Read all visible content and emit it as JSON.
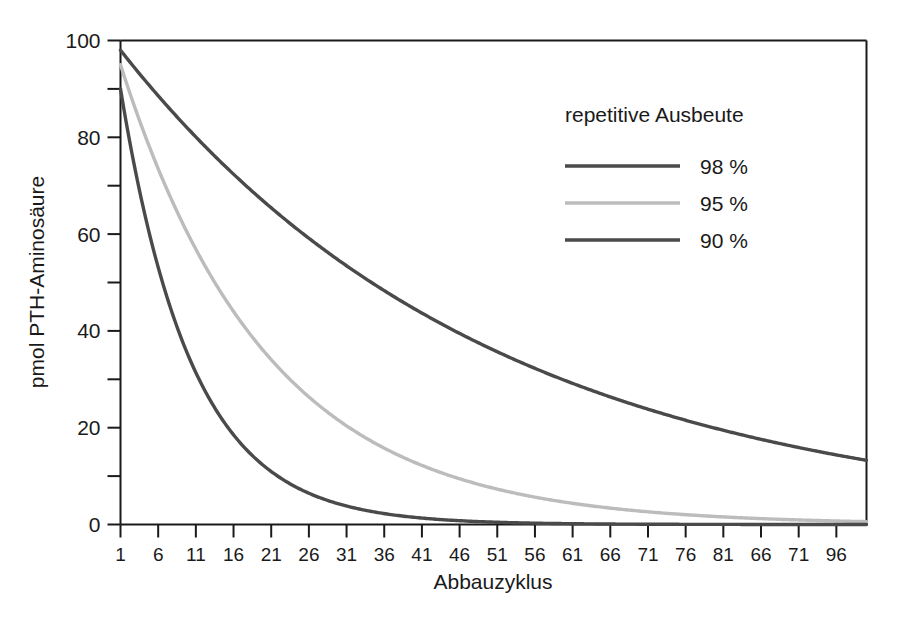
{
  "chart_data": {
    "type": "line",
    "title": "",
    "subtitle": "",
    "xlabel": "Abbauzyklus",
    "ylabel": "pmol PTH-Aminosäure",
    "xlim": [
      1,
      100
    ],
    "ylim": [
      0,
      100
    ],
    "grid": false,
    "legend_position": "top-right",
    "legend_title": "repetitive Ausbeute",
    "y_major_ticks": [
      0,
      20,
      40,
      60,
      80,
      100
    ],
    "y_major_tick_labels": [
      "0",
      "20",
      "40",
      "60",
      "80",
      "100"
    ],
    "y_minor_ticks": [
      10,
      30,
      50,
      70,
      90
    ],
    "x_tick_values": [
      1,
      6,
      11,
      16,
      21,
      26,
      31,
      36,
      41,
      46,
      51,
      56,
      61,
      66,
      71,
      76,
      81,
      86,
      91,
      96
    ],
    "x_tick_labels": [
      "1",
      "6",
      "11",
      "16",
      "21",
      "26",
      "31",
      "36",
      "41",
      "46",
      "51",
      "56",
      "61",
      "66",
      "71",
      "76",
      "81",
      "66",
      "71",
      "96"
    ],
    "series": [
      {
        "name": "98 %",
        "color": "#4a4a4a",
        "yield": 0.98,
        "start_value": 98,
        "x": [
          1,
          6,
          11,
          16,
          21,
          26,
          31,
          36,
          41,
          46,
          51,
          56,
          61,
          66,
          71,
          76,
          81,
          86,
          91,
          96,
          100
        ],
        "values": [
          98.0,
          88.6,
          80.1,
          72.4,
          65.4,
          59.1,
          53.4,
          48.3,
          43.7,
          39.5,
          35.7,
          32.3,
          29.2,
          26.4,
          23.8,
          21.5,
          19.5,
          17.6,
          15.9,
          14.4,
          13.3
        ]
      },
      {
        "name": "95 %",
        "color": "#bcbcbc",
        "yield": 0.95,
        "start_value": 95,
        "x": [
          1,
          6,
          11,
          16,
          21,
          26,
          31,
          36,
          41,
          46,
          51,
          56,
          61,
          66,
          71,
          76,
          81,
          86,
          91,
          96,
          100
        ],
        "values": [
          95.0,
          73.4,
          56.8,
          43.9,
          33.9,
          26.2,
          20.3,
          15.7,
          12.1,
          9.4,
          7.2,
          5.6,
          4.3,
          3.3,
          2.6,
          2.0,
          1.5,
          1.2,
          0.9,
          0.7,
          0.6
        ]
      },
      {
        "name": "90 %",
        "color": "#4a4a4a",
        "yield": 0.9,
        "start_value": 90,
        "x": [
          1,
          6,
          11,
          16,
          21,
          26,
          31,
          36,
          41,
          46,
          51,
          56,
          61,
          66,
          71,
          76,
          81,
          86,
          91,
          96,
          100
        ],
        "values": [
          90.0,
          53.1,
          31.4,
          18.5,
          10.9,
          6.5,
          3.8,
          2.3,
          1.3,
          0.8,
          0.5,
          0.3,
          0.2,
          0.1,
          0.06,
          0.04,
          0.02,
          0.01,
          0.01,
          0.0,
          0.0
        ]
      }
    ]
  },
  "legend": {
    "title": "repetitive Ausbeute",
    "entries": [
      {
        "label": "98 %",
        "color": "#4a4a4a"
      },
      {
        "label": "95 %",
        "color": "#bcbcbc"
      },
      {
        "label": "90 %",
        "color": "#4a4a4a"
      }
    ]
  },
  "axes": {
    "x_title": "Abbauzyklus",
    "y_title": "pmol PTH-Aminosäure"
  },
  "colors": {
    "background": "#ffffff",
    "axis": "#1a1a1a",
    "dark_series": "#4a4a4a",
    "light_series": "#bcbcbc",
    "text": "#1a1a1a"
  }
}
